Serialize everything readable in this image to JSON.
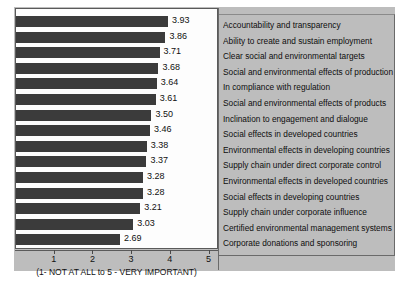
{
  "chart_data": {
    "type": "bar",
    "orientation": "horizontal",
    "title": "",
    "subtitle": "",
    "xlabel": "(1- NOT AT ALL to 5 - VERY IMPORTANT)",
    "ylabel": "",
    "xlim": [
      0,
      5
    ],
    "xticks": [
      1,
      2,
      3,
      4,
      5
    ],
    "xtick_labels": [
      "1",
      "2",
      "3",
      "4",
      "5"
    ],
    "grid": false,
    "legend_position": "right",
    "bar_color": "#3b3b3b",
    "plot_background": "#fdfdfd",
    "canvas_background": "#bdbdbd",
    "categories": [
      "Accountability and transparency",
      "Ability to create and sustain employment",
      "Clear social and environmental targets",
      "Social and environmental effects of production",
      "In compliance with regulation",
      "Social and environmental effects of products",
      "Inclination to engagement and dialogue",
      "Social effects in developed countries",
      "Environmental effects in developing countries",
      "Supply chain under direct corporate control",
      "Environmental effects in developed countries",
      "Social effects in developing countries",
      "Supply chain under corporate influence",
      "Certified environmental management systems",
      "Corporate donations and sponsoring"
    ],
    "values": [
      3.93,
      3.86,
      3.71,
      3.68,
      3.64,
      3.61,
      3.5,
      3.46,
      3.38,
      3.37,
      3.28,
      3.28,
      3.21,
      3.03,
      2.69
    ],
    "value_labels": [
      "3.93",
      "3.86",
      "3.71",
      "3.68",
      "3.64",
      "3.61",
      "3.50",
      "3.46",
      "3.38",
      "3.37",
      "3.28",
      "3.28",
      "3.21",
      "3.03",
      "2.69"
    ]
  }
}
